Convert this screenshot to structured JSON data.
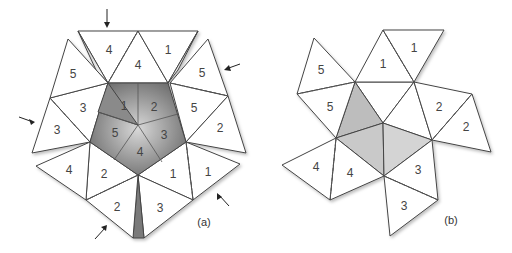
{
  "panels": [
    {
      "id": "a",
      "label": "(a)",
      "center_numbers": [
        "1",
        "2",
        "3",
        "4",
        "5"
      ],
      "outer_numbers": {
        "top_left_4": "4",
        "top_inner_4": "4",
        "top_right_1": "1",
        "upper_right_5_outer": "5",
        "upper_right_5_inner": "5",
        "right_2": "2",
        "lower_right_1_outer": "1",
        "lower_right_1_inner": "1",
        "bottom_3": "3",
        "bottom_2_outer": "2",
        "bottom_left_2_inner": "2",
        "lower_left_4": "4",
        "left_3_outer": "3",
        "left_3_inner": "3",
        "upper_left_5": "5"
      },
      "arrow_count": 5
    },
    {
      "id": "b",
      "label": "(b)",
      "numbers": {
        "top_inner_1": "1",
        "top_outer_1": "1",
        "right_inner_2": "2",
        "right_outer_2": "2",
        "bottom_inner_3": "3",
        "bottom_outer_3": "3",
        "left_inner_4": "4",
        "left_outer_4": "4",
        "upper_left_outer_5": "5",
        "upper_left_inner_5": "5"
      }
    }
  ],
  "colors": {
    "stroke": "#444444",
    "face": "#ffffff",
    "shade_dark": "#6f6f6f",
    "shade_light": "#e6e6e6"
  }
}
